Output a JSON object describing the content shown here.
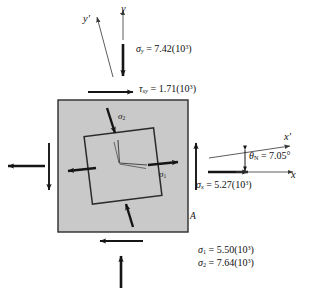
{
  "figure": {
    "type": "stress-element-diagram",
    "colors": {
      "element_fill": "#c9c9c9",
      "element_stroke": "#2a2a2a",
      "arrow": "#151515",
      "thin_line": "#4a4a4a",
      "background": "#ffffff"
    }
  },
  "axes": {
    "y_label": "y",
    "y_prime_label": "y′",
    "x_label": "x",
    "x_prime_label": "x′"
  },
  "labels": {
    "sigma_y": {
      "symbol": "σ",
      "sub": "y",
      "equals": "=",
      "value": "7.42",
      "power_base": "(10",
      "power_exp": "3",
      "power_close": ")",
      "full": "σy = 7.42(10³)"
    },
    "tau_xy": {
      "symbol": "τ",
      "sub": "xy",
      "equals": "=",
      "value": "1.71",
      "power_base": "(10",
      "power_exp": "3",
      "power_close": ")",
      "full": "τxy = 1.71(10³)"
    },
    "sigma_x": {
      "symbol": "σ",
      "sub": "x",
      "equals": "=",
      "value": "5.27",
      "power_base": "(10",
      "power_exp": "3",
      "power_close": ")",
      "full": "σx = 5.27(10³)"
    },
    "theta": {
      "symbol": "θ",
      "sub": "N",
      "equals": "=",
      "value": "7.05",
      "unit": "°",
      "full": "θN = 7.05°"
    },
    "sigma_1_result": {
      "symbol": "σ",
      "sub": "1",
      "equals": "=",
      "value": "5.50",
      "power_base": "(10",
      "power_exp": "3",
      "power_close": ")",
      "full": "σ1 = 5.50(10³)"
    },
    "sigma_2_result": {
      "symbol": "σ",
      "sub": "2",
      "equals": "=",
      "value": "7.64",
      "power_base": "(10",
      "power_exp": "3",
      "power_close": ")",
      "full": "σ2 = 7.64(10³)"
    },
    "sigma_1_element": {
      "symbol": "σ",
      "sub": "1"
    },
    "sigma_2_element": {
      "symbol": "σ",
      "sub": "2"
    },
    "point_A": "A"
  },
  "values": {
    "sigma_x": 5.27,
    "sigma_y": 7.42,
    "tau_xy": 1.71,
    "sigma_1": 5.5,
    "sigma_2": 7.64,
    "theta_deg": 7.05,
    "stress_multiplier": 1000
  }
}
